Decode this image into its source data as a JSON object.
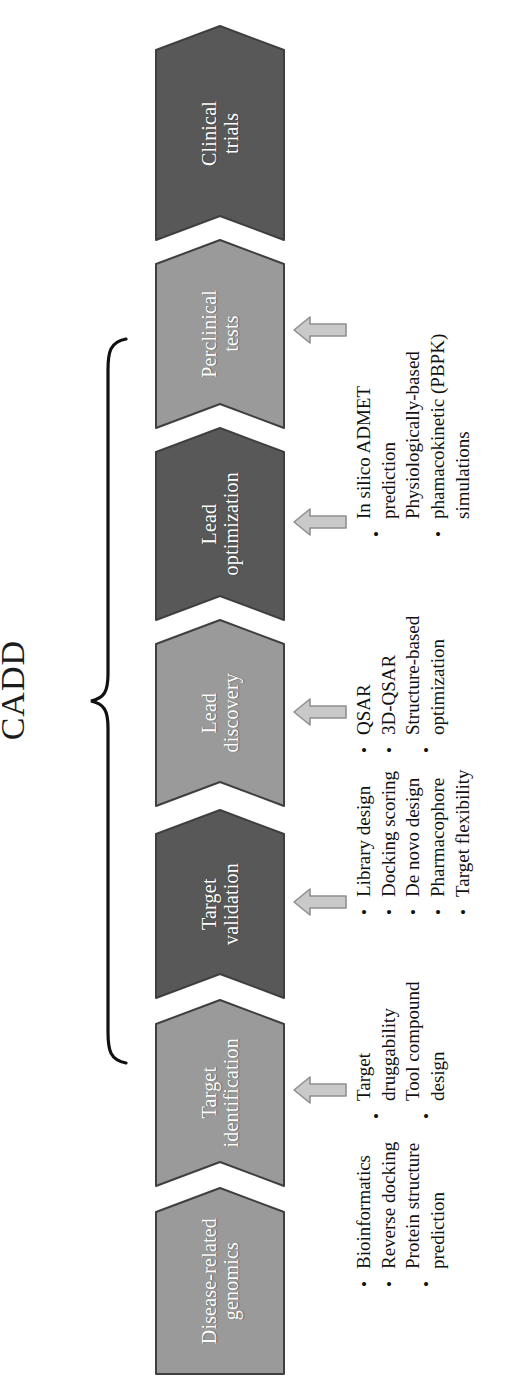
{
  "figure": {
    "bracket_label": "CADD",
    "stages": [
      {
        "id": "clinical-trials",
        "label": "Clinical\ntrials",
        "tone": "dark",
        "bullets": []
      },
      {
        "id": "perclinical-tests",
        "label": "Perclinical\ntests",
        "tone": "light",
        "bullets": [
          "In silico ADMET\nprediction",
          "Physiologically-based\nphamacokinetic (PBPK)\nsimulations"
        ]
      },
      {
        "id": "lead-optimization",
        "label": "Lead\noptimization",
        "tone": "dark",
        "bullets": [
          "QSAR",
          "3D-QSAR",
          "Structure-based\noptimization"
        ]
      },
      {
        "id": "lead-discovery",
        "label": "Lead\ndiscovery",
        "tone": "light",
        "bullets": [
          "Library design",
          "Docking scoring",
          "De novo design",
          "Pharmacophore",
          "Target flexibility"
        ]
      },
      {
        "id": "target-validation",
        "label": "Target\nvalidation",
        "tone": "dark",
        "bullets": [
          "Target\ndruggability",
          "Tool compound\ndesign"
        ]
      },
      {
        "id": "target-identification",
        "label": "Target\nidentification",
        "tone": "light",
        "bullets": [
          "Bioinformatics",
          "Reverse docking",
          "Protein structure\nprediction"
        ]
      },
      {
        "id": "disease-related-genomics",
        "label": "Disease-related\ngenomics",
        "tone": "light",
        "bullets": []
      }
    ],
    "colors": {
      "chevron_dark": "#585858",
      "chevron_light": "#9a9a9a",
      "chevron_edge": "#3f3f3f",
      "arrow_fill": "#c9c9c9",
      "arrow_edge": "#8f8f8f",
      "label_text": "#ffffff",
      "bullet_text": "#111111",
      "brace": "#111111",
      "background": "#ffffff"
    }
  }
}
